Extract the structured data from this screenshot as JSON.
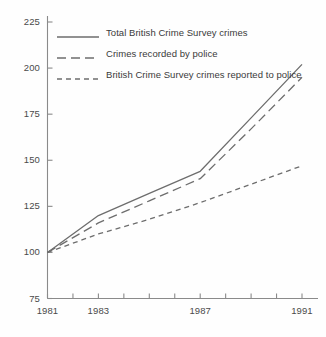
{
  "chart_data": {
    "type": "line",
    "title": "",
    "subtitle": "",
    "xlabel": "",
    "ylabel": "",
    "xlim": [
      1981,
      1991
    ],
    "ylim": [
      75,
      225
    ],
    "grid": false,
    "legend_position": "top-left",
    "index_base": "1981 = 100",
    "x": [
      1981,
      1983,
      1985,
      1987,
      1989,
      1991
    ],
    "xticks": [
      1981,
      1982,
      1983,
      1984,
      1985,
      1986,
      1987,
      1988,
      1989,
      1990,
      1991
    ],
    "xtick_labels": [
      "1981",
      "",
      "1983",
      "",
      "",
      "",
      "1987",
      "",
      "",
      "",
      "1991"
    ],
    "yticks": [
      75,
      100,
      125,
      150,
      175,
      200,
      225
    ],
    "ytick_labels": [
      "75",
      "100",
      "125",
      "150",
      "175",
      "200",
      "225"
    ],
    "series": [
      {
        "name": "Total British Crime Survey crimes",
        "style": "solid",
        "color": "#6d6d6d",
        "values": [
          100,
          120,
          132,
          144,
          173,
          202
        ]
      },
      {
        "name": "Crimes recorded by police",
        "style": "long-dash",
        "color": "#6d6d6d",
        "values": [
          100,
          116,
          128,
          140,
          167,
          195
        ]
      },
      {
        "name": "British Crime Survey crimes reported to police",
        "style": "short-dash",
        "color": "#6d6d6d",
        "values": [
          100,
          110,
          118,
          127,
          137,
          147
        ]
      }
    ]
  },
  "legend": {
    "items": [
      {
        "label": "Total British Crime Survey crimes"
      },
      {
        "label": "Crimes recorded by police"
      },
      {
        "label": "British Crime Survey crimes reported to police"
      }
    ]
  },
  "axes": {
    "y": {
      "labels": [
        "225",
        "200",
        "175",
        "150",
        "125",
        "100",
        "75"
      ]
    },
    "x": {
      "labels": [
        "1981",
        "1983",
        "1987",
        "1991"
      ]
    }
  }
}
